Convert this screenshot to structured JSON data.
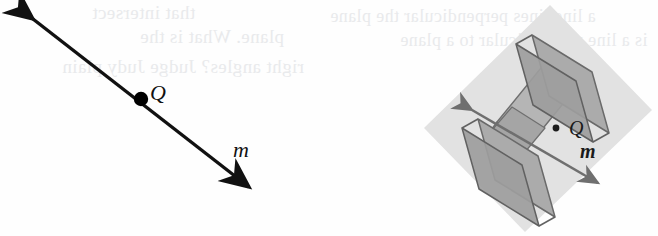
{
  "figure": {
    "background_color": "#fefefe",
    "width": 658,
    "height": 236
  },
  "left_diagram": {
    "name": "two-dimensional line diagram",
    "line_color": "#111111",
    "point_color": "#000000",
    "point_label": "Q",
    "line_label": "m",
    "arrow_start": {
      "x": 27,
      "y": 13
    },
    "arrow_end": {
      "x": 255,
      "y": 192
    },
    "point_position": {
      "x": 141,
      "y": 99
    }
  },
  "right_diagram": {
    "name": "three-dimensional plane and line diagram",
    "plane_color": "#e0e0e0",
    "prism_fill": "#a8a8a8",
    "prism_fill_light": "#b9b9b9",
    "prism_fill_dark": "#8e8e8e",
    "edge_color": "#6a6a6a",
    "point_label": "Q",
    "line_label": "m",
    "plane_corners": [
      {
        "x": 550,
        "y": 5
      },
      {
        "x": 652,
        "y": 110
      },
      {
        "x": 525,
        "y": 232
      },
      {
        "x": 424,
        "y": 128
      }
    ],
    "point_position": {
      "x": 556,
      "y": 128
    },
    "arrow_start": {
      "x": 466,
      "y": 106
    },
    "arrow_end": {
      "x": 603,
      "y": 186
    }
  },
  "showthrough_text": {
    "note": "faint mirrored bleed-through text from reverse side of page",
    "lines": [
      "that intersect",
      "plane. What is the",
      "right angles? Judge Judy plain",
      "a line lines perpendicular the plane",
      "is a line perpendicular to a plane",
      "at the given point"
    ]
  }
}
